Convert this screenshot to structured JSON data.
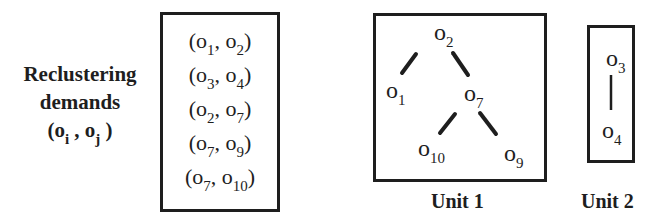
{
  "title_block": {
    "line1": "Reclustering",
    "line2": "demands",
    "pair_open": "(o",
    "pair_i": "i",
    "pair_sep": " , o",
    "pair_j": "j",
    "pair_close": " )"
  },
  "demands": [
    {
      "a": "1",
      "b": "2"
    },
    {
      "a": "3",
      "b": "4"
    },
    {
      "a": "2",
      "b": "7"
    },
    {
      "a": "7",
      "b": "9"
    },
    {
      "a": "7",
      "b": "10"
    }
  ],
  "node_symbol": "o",
  "unit1": {
    "label": "Unit 1",
    "nodes": {
      "n2": "2",
      "n1": "1",
      "n7": "7",
      "n10": "10",
      "n9": "9"
    },
    "edges": [
      [
        "o2",
        "o1"
      ],
      [
        "o2",
        "o7"
      ],
      [
        "o7",
        "o10"
      ],
      [
        "o7",
        "o9"
      ]
    ]
  },
  "unit2": {
    "label": "Unit 2",
    "nodes": {
      "n3": "3",
      "n4": "4"
    },
    "edges": [
      [
        "o3",
        "o4"
      ]
    ]
  },
  "colors": {
    "ink": "#1e1e1e",
    "background": "#ffffff"
  }
}
